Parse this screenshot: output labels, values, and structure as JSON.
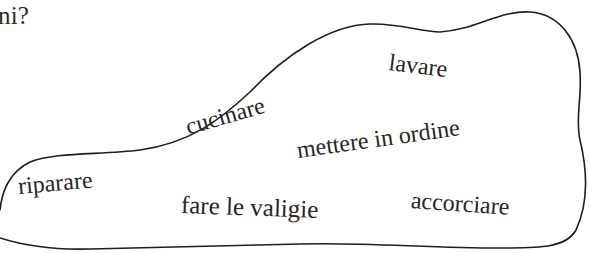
{
  "question": {
    "fragment": "ni?"
  },
  "word_cloud": {
    "words": [
      {
        "id": "lavare",
        "text": "lavare"
      },
      {
        "id": "cucinare",
        "text": "cucinare"
      },
      {
        "id": "mettere-in-ordine",
        "text": "mettere in ordine"
      },
      {
        "id": "riparare",
        "text": "riparare"
      },
      {
        "id": "fare-le-valigie",
        "text": "fare le valigie"
      },
      {
        "id": "accorciare",
        "text": "accorciare"
      }
    ]
  },
  "colors": {
    "ink": "#262626",
    "outline": "#1e1e1e",
    "paper": "#ffffff"
  }
}
